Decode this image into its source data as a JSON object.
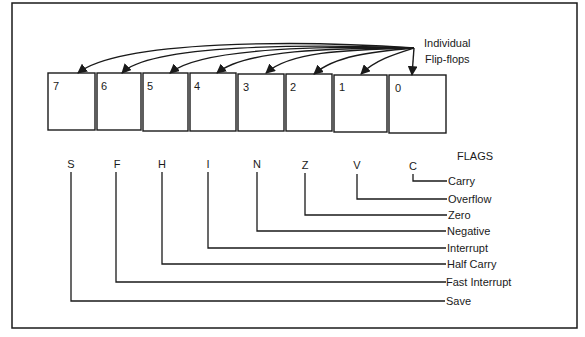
{
  "title_annotation": [
    "Individual",
    "Flip-flops"
  ],
  "flags_heading": "FLAGS",
  "bits": [
    {
      "index": "7",
      "letter": "S",
      "name": "Save"
    },
    {
      "index": "6",
      "letter": "F",
      "name": "Fast Interrupt"
    },
    {
      "index": "5",
      "letter": "H",
      "name": "Half Carry"
    },
    {
      "index": "4",
      "letter": "I",
      "name": "Interrupt"
    },
    {
      "index": "3",
      "letter": "N",
      "name": "Negative"
    },
    {
      "index": "2",
      "letter": "Z",
      "name": "Zero"
    },
    {
      "index": "1",
      "letter": "V",
      "name": "Overflow"
    },
    {
      "index": "0",
      "letter": "C",
      "name": "Carry"
    }
  ],
  "colors": {
    "line": "#1a1a1a",
    "background": "#ffffff"
  }
}
